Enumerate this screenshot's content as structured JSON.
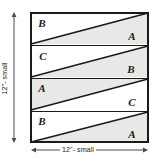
{
  "diagram": {
    "shape": "square",
    "width_label": "12\"- small",
    "height_label": "12\"- small",
    "colors": {
      "shade": "#e8e8e6",
      "white": "#ffffff",
      "line": "#1a1a1a",
      "dimension_line": "#4a4a4a"
    },
    "bands": [
      {
        "index": 1,
        "upper_left_label": "B",
        "lower_right_label": "A",
        "upper_left_fill": "white",
        "lower_right_fill": "shade"
      },
      {
        "index": 2,
        "upper_left_label": "C",
        "lower_right_label": "B",
        "upper_left_fill": "white",
        "lower_right_fill": "shade"
      },
      {
        "index": 3,
        "upper_left_label": "A",
        "lower_right_label": "C",
        "upper_left_fill": "shade",
        "lower_right_fill": "white"
      },
      {
        "index": 4,
        "upper_left_label": "B",
        "lower_right_label": "A",
        "upper_left_fill": "white",
        "lower_right_fill": "shade"
      }
    ]
  }
}
